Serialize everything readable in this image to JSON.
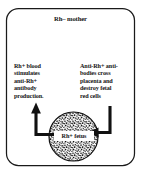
{
  "figure": {
    "frame": {
      "name": "mother-body-frame",
      "shape": "rounded-rectangle",
      "stroke_color": "#1a1a1a"
    },
    "mother_label": "Rh– mother",
    "left_text": "Rh+ blood\nstimulates\nanti-Rh+\nantibody\nproduction.",
    "right_text": "Anti-Rh+ anti-\nbodies cross\nplacenta and\ndestroy fetal\nred cells",
    "fetus_label": "Rh+ fetus",
    "fetus": {
      "name": "fetus-circle",
      "fill_pattern": "stipple",
      "stroke_color": "#1a1a1a"
    },
    "arrows": [
      {
        "name": "rh-positive-blood-arrow",
        "direction": "from-fetus-up-left",
        "color": "#111111"
      },
      {
        "name": "antibody-arrow",
        "direction": "from-right-down-into-fetus",
        "color": "#111111"
      }
    ],
    "colors": {
      "ink": "#1a1a1a",
      "background": "#ffffff"
    }
  }
}
